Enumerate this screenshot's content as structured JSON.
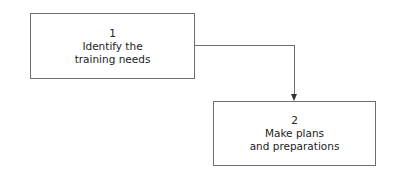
{
  "diagram": {
    "type": "flowchart",
    "nodes": [
      {
        "id": "step1",
        "number": "1",
        "line1": "Identify the",
        "line2": "training needs"
      },
      {
        "id": "step2",
        "number": "2",
        "line1": "Make plans",
        "line2": "and preparations"
      }
    ],
    "edges": [
      {
        "from": "step1",
        "to": "step2",
        "style": "elbow-arrow"
      }
    ],
    "colors": {
      "border": "#6e6e6e",
      "text": "#222222",
      "arrow": "#333333",
      "background": "#ffffff"
    }
  }
}
